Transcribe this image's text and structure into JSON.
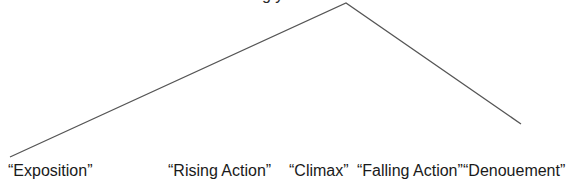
{
  "diagram": {
    "type": "plot-structure-arc",
    "title_fragment": "g y",
    "line_color": "#555555",
    "points": {
      "start": {
        "x": 10,
        "y": 157
      },
      "apex": {
        "x": 346,
        "y": 3
      },
      "end": {
        "x": 521,
        "y": 124
      }
    },
    "labels": [
      {
        "text": "“Exposition”",
        "x": 8
      },
      {
        "text": "“Rising Action”",
        "x": 168
      },
      {
        "text": "“Climax”",
        "x": 289
      },
      {
        "text": "“Falling Action”",
        "x": 357
      },
      {
        "text": "“Denouement”",
        "x": 463
      }
    ]
  }
}
